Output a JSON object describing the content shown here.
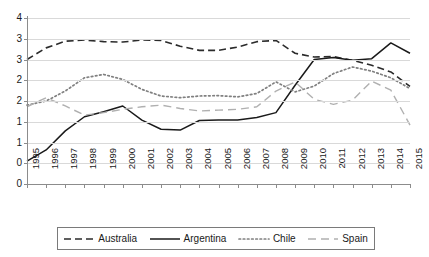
{
  "chart_data": {
    "type": "line",
    "title": "",
    "subtitle": "",
    "xlabel": "",
    "ylabel": "",
    "xlim": [
      1995,
      2015
    ],
    "ylim": [
      0,
      4
    ],
    "ytick_step": 0.5,
    "grid": true,
    "legend_position": "bottom",
    "x": [
      1995,
      1996,
      1997,
      1998,
      1999,
      2000,
      2001,
      2002,
      2003,
      2004,
      2005,
      2006,
      2007,
      2008,
      2009,
      2010,
      2011,
      2012,
      2013,
      2014,
      2015
    ],
    "xtick_labels": [
      "1995",
      "1996",
      "1997",
      "1998",
      "1999",
      "2000",
      "2001",
      "2002",
      "2003",
      "2004",
      "2005",
      "2006",
      "2007",
      "2008",
      "2009",
      "2010",
      "2011",
      "2012",
      "2013",
      "2014",
      "2015"
    ],
    "ytick_labels": [
      "4",
      "3",
      "3",
      "2",
      "2",
      "1",
      "1",
      "0"
    ],
    "ytick_values": [
      4.0,
      3.5,
      3.0,
      2.5,
      2.0,
      1.5,
      1.0,
      0.5,
      0.0
    ],
    "series": [
      {
        "name": "Australia",
        "style": "dashed",
        "color": "#2b2b2b",
        "values": [
          3.0,
          3.28,
          3.44,
          3.47,
          3.43,
          3.42,
          3.47,
          3.46,
          3.32,
          3.22,
          3.22,
          3.3,
          3.43,
          3.46,
          3.15,
          3.06,
          3.07,
          2.98,
          2.86,
          2.7,
          2.35
        ]
      },
      {
        "name": "Argentina",
        "style": "solid",
        "color": "#1a1a1a",
        "values": [
          0.55,
          0.82,
          1.28,
          1.62,
          1.74,
          1.88,
          1.54,
          1.32,
          1.3,
          1.53,
          1.54,
          1.54,
          1.6,
          1.72,
          2.38,
          3.0,
          3.05,
          2.98,
          3.02,
          3.4,
          3.15
        ]
      },
      {
        "name": "Chile",
        "style": "dotted",
        "color": "#808080",
        "values": [
          1.9,
          2.0,
          2.24,
          2.56,
          2.64,
          2.52,
          2.28,
          2.12,
          2.08,
          2.12,
          2.13,
          2.1,
          2.18,
          2.46,
          2.22,
          2.36,
          2.66,
          2.82,
          2.72,
          2.56,
          2.3
        ]
      },
      {
        "name": "Spain",
        "style": "longdash",
        "color": "#b0b0b0",
        "values": [
          1.86,
          2.08,
          1.88,
          1.66,
          1.72,
          1.8,
          1.86,
          1.9,
          1.82,
          1.76,
          1.78,
          1.8,
          1.86,
          2.24,
          2.46,
          2.04,
          1.92,
          2.02,
          2.48,
          2.26,
          1.42
        ]
      }
    ]
  },
  "legend": {
    "items": [
      {
        "label": "Australia"
      },
      {
        "label": "Argentina"
      },
      {
        "label": "Chile"
      },
      {
        "label": "Spain"
      }
    ]
  }
}
